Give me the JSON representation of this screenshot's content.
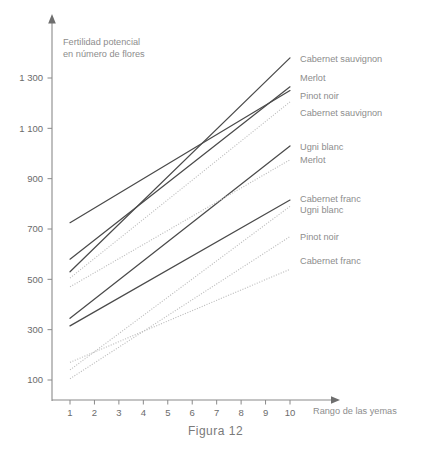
{
  "caption": "Figura 12",
  "chart_data": {
    "type": "line",
    "title": "",
    "xlabel": "Rango de las yemas",
    "ylabel": "Fertilidad potencial en número de flores",
    "ylabel_line1": "Fertilidad potencial",
    "ylabel_line2": "en número de flores",
    "x": [
      1,
      10
    ],
    "xticklabels": [
      "1",
      "2",
      "3",
      "4",
      "5",
      "6",
      "7",
      "8",
      "9",
      "10"
    ],
    "xlim": [
      0.55,
      10.6
    ],
    "ylim": [
      0,
      1420
    ],
    "yticks": [
      100,
      300,
      500,
      700,
      900,
      1100,
      1300
    ],
    "yticklabels": [
      "100",
      "300",
      "500",
      "700",
      "900",
      "1 100",
      "1 300"
    ],
    "grid": false,
    "legend_position": "right-inline-end-of-line",
    "colors": {
      "solid": "#4a4a4a",
      "dotted": "#bdbdbd",
      "axis": "#8a8a8a",
      "text": "#6b6b6b",
      "label": "#8d8d8d"
    },
    "series": [
      {
        "name": "Cabernet sauvignon",
        "style": "solid",
        "label": "Cabernet sauvignon",
        "x": [
          1,
          10
        ],
        "values": [
          530,
          1380
        ],
        "label_y": 1375
      },
      {
        "name": "Merlot (alto)",
        "style": "solid",
        "label": "Merlot",
        "x": [
          1,
          10
        ],
        "values": [
          580,
          1265
        ],
        "label_y": 1300
      },
      {
        "name": "Pinot noir (alto)",
        "style": "solid",
        "label": "Pinot noir",
        "x": [
          1,
          10
        ],
        "values": [
          725,
          1250
        ],
        "label_y": 1230
      },
      {
        "name": "Cabernet sauvignon (punteada)",
        "style": "dotted",
        "label": "Cabernet sauvignon",
        "x": [
          1,
          10
        ],
        "values": [
          505,
          1205
        ],
        "label_y": 1160
      },
      {
        "name": "Ugni blanc (solida)",
        "style": "solid",
        "label": "Ugni blanc",
        "x": [
          1,
          10
        ],
        "values": [
          345,
          1030
        ],
        "label_y": 1025
      },
      {
        "name": "Merlot (punteada)",
        "style": "dotted",
        "label": "Merlot",
        "x": [
          1,
          10
        ],
        "values": [
          470,
          975
        ],
        "label_y": 975
      },
      {
        "name": "Cabernet franc (solida)",
        "style": "solid",
        "label": "Cabernet franc",
        "x": [
          1,
          10
        ],
        "values": [
          315,
          815
        ],
        "label_y": 820
      },
      {
        "name": "Ugni blanc (punteada)",
        "style": "dotted",
        "label": "Ugni blanc",
        "x": [
          1,
          10
        ],
        "values": [
          140,
          790
        ],
        "label_y": 775
      },
      {
        "name": "Pinot noir (punteada)",
        "style": "dotted",
        "label": "Pinot noir",
        "x": [
          1,
          10
        ],
        "values": [
          105,
          670
        ],
        "label_y": 670
      },
      {
        "name": "Cabernet franc (punteada)",
        "style": "dotted",
        "label": "Cabernet franc",
        "x": [
          1,
          10
        ],
        "values": [
          170,
          540
        ],
        "label_y": 575
      }
    ]
  }
}
